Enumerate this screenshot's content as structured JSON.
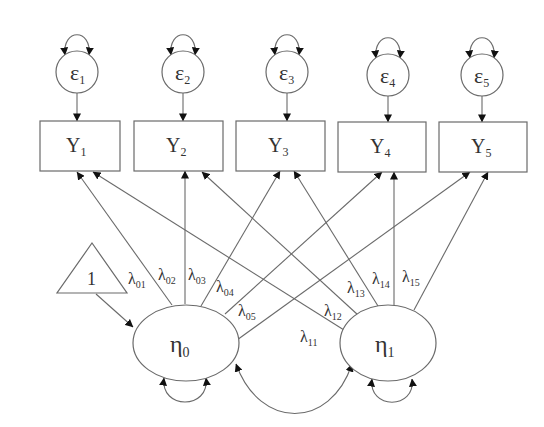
{
  "diagram": {
    "type": "latent growth curve model (structural equation path diagram)",
    "errors": [
      {
        "id": "e1",
        "symbol": "ε",
        "sub": "1",
        "cx": 77,
        "cy": 72
      },
      {
        "id": "e2",
        "symbol": "ε",
        "sub": "2",
        "cx": 183,
        "cy": 72
      },
      {
        "id": "e3",
        "symbol": "ε",
        "sub": "3",
        "cx": 287,
        "cy": 72
      },
      {
        "id": "e4",
        "symbol": "ε",
        "sub": "4",
        "cx": 388,
        "cy": 75
      },
      {
        "id": "e5",
        "symbol": "ε",
        "sub": "5",
        "cx": 482,
        "cy": 75
      }
    ],
    "observed": [
      {
        "id": "Y1",
        "symbol": "Y",
        "sub": "1",
        "x": 40,
        "y": 121,
        "w": 80,
        "h": 50
      },
      {
        "id": "Y2",
        "symbol": "Y",
        "sub": "2",
        "x": 134,
        "y": 121,
        "w": 89,
        "h": 50
      },
      {
        "id": "Y3",
        "symbol": "Y",
        "sub": "3",
        "x": 236,
        "y": 121,
        "w": 89,
        "h": 50
      },
      {
        "id": "Y4",
        "symbol": "Y",
        "sub": "4",
        "x": 338,
        "y": 122,
        "w": 88,
        "h": 50
      },
      {
        "id": "Y5",
        "symbol": "Y",
        "sub": "5",
        "x": 439,
        "y": 122,
        "w": 88,
        "h": 50
      }
    ],
    "constant": {
      "label": "1"
    },
    "latents": [
      {
        "id": "eta0",
        "symbol": "η",
        "sub": "0",
        "cx": 186,
        "cy": 343
      },
      {
        "id": "eta1",
        "symbol": "η",
        "sub": "1",
        "cx": 388,
        "cy": 343
      }
    ],
    "loadings": [
      {
        "symbol": "λ",
        "sub": "01"
      },
      {
        "symbol": "λ",
        "sub": "02"
      },
      {
        "symbol": "λ",
        "sub": "03"
      },
      {
        "symbol": "λ",
        "sub": "04"
      },
      {
        "symbol": "λ",
        "sub": "05"
      },
      {
        "symbol": "λ",
        "sub": "11"
      },
      {
        "symbol": "λ",
        "sub": "12"
      },
      {
        "symbol": "λ",
        "sub": "13"
      },
      {
        "symbol": "λ",
        "sub": "14"
      },
      {
        "symbol": "λ",
        "sub": "15"
      }
    ]
  }
}
